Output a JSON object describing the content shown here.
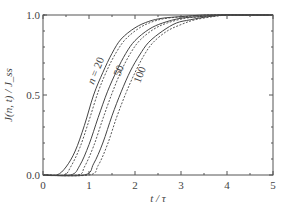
{
  "chart_data": {
    "type": "line",
    "title": "",
    "xlabel": "t / τ",
    "ylabel": "J(n, t) / J_ss",
    "xlim": [
      0,
      5
    ],
    "ylim": [
      0,
      1.0
    ],
    "x_ticks": [
      0,
      1,
      2,
      3,
      4,
      5
    ],
    "x_tick_labels": [
      "0",
      "1",
      "2",
      "3",
      "4",
      "5"
    ],
    "y_ticks": [
      0.0,
      0.5,
      1.0
    ],
    "y_tick_labels": [
      "0.0",
      "0.5",
      "1.0"
    ],
    "grid": false,
    "legend": "inline curve labels",
    "curve_labels": [
      {
        "text": "n = 20",
        "series": "n=20"
      },
      {
        "text": "50",
        "series": "n=50"
      },
      {
        "text": "100",
        "series": "n=100"
      }
    ],
    "series": [
      {
        "name": "n=20 (solid)",
        "style": "solid",
        "x": [
          0,
          0.3,
          0.5,
          0.7,
          0.9,
          1.1,
          1.3,
          1.5,
          1.7,
          2.0,
          2.3,
          2.6,
          3.0,
          3.5,
          4.0,
          5.0
        ],
        "y": [
          0,
          0.0,
          0.05,
          0.15,
          0.31,
          0.5,
          0.64,
          0.76,
          0.85,
          0.92,
          0.96,
          0.98,
          0.99,
          1.0,
          1.0,
          1.0
        ]
      },
      {
        "name": "n=20 (dashed)",
        "style": "dashed",
        "x": [
          0,
          0.45,
          0.6,
          0.8,
          1.0,
          1.2,
          1.4,
          1.6,
          1.8,
          2.1,
          2.4,
          2.7,
          3.1,
          3.6,
          4.0,
          5.0
        ],
        "y": [
          0,
          0.0,
          0.05,
          0.17,
          0.34,
          0.52,
          0.66,
          0.77,
          0.85,
          0.92,
          0.96,
          0.98,
          0.99,
          1.0,
          1.0,
          1.0
        ]
      },
      {
        "name": "n=50 (solid)",
        "style": "solid",
        "x": [
          0,
          0.6,
          0.8,
          1.0,
          1.2,
          1.4,
          1.6,
          1.8,
          2.0,
          2.3,
          2.6,
          3.0,
          3.4,
          3.8,
          4.2,
          5.0
        ],
        "y": [
          0,
          0.0,
          0.06,
          0.19,
          0.36,
          0.52,
          0.65,
          0.76,
          0.84,
          0.91,
          0.95,
          0.98,
          0.99,
          1.0,
          1.0,
          1.0
        ]
      },
      {
        "name": "n=50 (dashed)",
        "style": "dashed",
        "x": [
          0,
          0.75,
          0.9,
          1.1,
          1.3,
          1.5,
          1.7,
          1.9,
          2.1,
          2.4,
          2.7,
          3.1,
          3.5,
          3.9,
          4.2,
          5.0
        ],
        "y": [
          0,
          0.0,
          0.05,
          0.18,
          0.35,
          0.51,
          0.65,
          0.76,
          0.84,
          0.91,
          0.95,
          0.98,
          0.99,
          1.0,
          1.0,
          1.0
        ]
      },
      {
        "name": "n=100 (solid)",
        "style": "solid",
        "x": [
          0,
          0.9,
          1.1,
          1.3,
          1.5,
          1.7,
          1.9,
          2.1,
          2.3,
          2.6,
          2.9,
          3.2,
          3.6,
          4.0,
          4.3,
          5.0
        ],
        "y": [
          0,
          0.0,
          0.07,
          0.2,
          0.37,
          0.52,
          0.65,
          0.75,
          0.83,
          0.9,
          0.95,
          0.97,
          0.99,
          1.0,
          1.0,
          1.0
        ]
      },
      {
        "name": "n=100 (dashed)",
        "style": "dashed",
        "x": [
          0,
          1.0,
          1.2,
          1.4,
          1.6,
          1.8,
          2.0,
          2.2,
          2.4,
          2.7,
          3.0,
          3.3,
          3.7,
          4.0,
          4.3,
          5.0
        ],
        "y": [
          0,
          0.0,
          0.06,
          0.19,
          0.36,
          0.51,
          0.64,
          0.75,
          0.83,
          0.9,
          0.94,
          0.97,
          0.99,
          1.0,
          1.0,
          1.0
        ]
      }
    ]
  },
  "colors": {
    "axis": "#555555",
    "curve": "#444444",
    "text": "#444444"
  }
}
